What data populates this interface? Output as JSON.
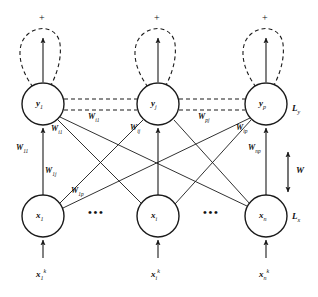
{
  "figure": {
    "type": "neural-network-diagram",
    "stroke_color": "#1a1a1a",
    "text_color": "#111111",
    "background": "#ffffff"
  },
  "layers": {
    "output": {
      "layer_label": "L",
      "layer_label_sub": "y",
      "nodes": [
        {
          "name": "y",
          "sub": "1",
          "cx": 43,
          "cy": 104,
          "r": 21
        },
        {
          "name": "y",
          "sub": "j",
          "cx": 158,
          "cy": 104,
          "r": 21
        },
        {
          "name": "y",
          "sub": "p",
          "cx": 266,
          "cy": 104,
          "r": 21
        }
      ]
    },
    "input": {
      "layer_label": "L",
      "layer_label_sub": "x",
      "nodes": [
        {
          "name": "x",
          "sub": "1",
          "cx": 43,
          "cy": 216,
          "r": 21
        },
        {
          "name": "x",
          "sub": "i",
          "cx": 158,
          "cy": 216,
          "r": 21
        },
        {
          "name": "x",
          "sub": "n",
          "cx": 266,
          "cy": 216,
          "r": 21
        }
      ]
    }
  },
  "self_loops": {
    "sign": "+",
    "count": 3,
    "note": "dashed self-excitatory loop above each output node"
  },
  "lateral_weights": [
    {
      "label": "W",
      "sub": "i1",
      "x": 88,
      "y": 115
    },
    {
      "label": "W",
      "sub": "pj",
      "x": 198,
      "y": 115
    }
  ],
  "feedforward_weights": [
    {
      "label": "W",
      "sub": "11",
      "x": 16,
      "y": 146
    },
    {
      "label": "W",
      "sub": "i1",
      "x": 51,
      "y": 127
    },
    {
      "label": "W",
      "sub": "1j",
      "x": 45,
      "y": 169
    },
    {
      "label": "W",
      "sub": "1p",
      "x": 71,
      "y": 189
    },
    {
      "label": "W",
      "sub": "ij",
      "x": 130,
      "y": 126
    },
    {
      "label": "W",
      "sub": "ip",
      "x": 236,
      "y": 126
    },
    {
      "label": "W",
      "sub": "np",
      "x": 248,
      "y": 146
    }
  ],
  "weight_matrix": {
    "label": "W",
    "x": 296,
    "y": 170,
    "note": "bold W beside bidirectional vertical arrow"
  },
  "inputs": [
    {
      "base": "x",
      "sub": "1",
      "sup": "k",
      "x": 36,
      "y": 272
    },
    {
      "base": "x",
      "sub": "i",
      "sup": "k",
      "x": 151,
      "y": 272
    },
    {
      "base": "x",
      "sub": "n",
      "sup": "k",
      "x": 259,
      "y": 272
    }
  ],
  "ellipses": [
    {
      "text": "•••",
      "x": 94,
      "y": 211
    },
    {
      "text": "•••",
      "x": 209,
      "y": 211
    }
  ],
  "icons": {
    "plus": "plus-sign-icon",
    "arrow_up": "arrow-up-icon",
    "arrow_down": "arrow-down-icon",
    "self_loop": "self-loop-icon"
  }
}
